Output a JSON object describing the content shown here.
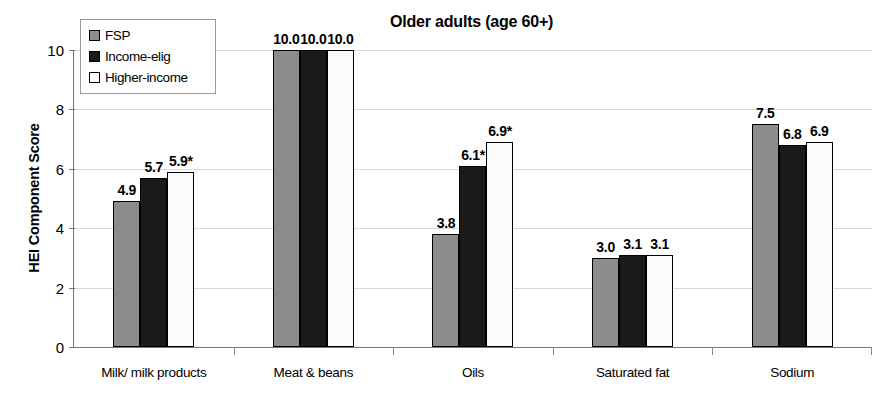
{
  "chart_data": {
    "type": "bar",
    "title": "Older adults (age 60+)",
    "xlabel": "",
    "ylabel": "HEI Component Score",
    "ylim": [
      0,
      10
    ],
    "yticks": [
      0,
      2,
      4,
      6,
      8,
      10
    ],
    "ytick_labels": [
      "0",
      "2",
      "4",
      "6",
      "8",
      "10"
    ],
    "grid": true,
    "legend_position": "upper-left-inside",
    "categories": [
      "Milk/ milk products",
      "Meat & beans",
      "Oils",
      "Saturated fat",
      "Sodium"
    ],
    "series": [
      {
        "name": "FSP",
        "color": "#8c8c8c",
        "values": [
          4.9,
          10.0,
          3.8,
          3.0,
          7.5
        ],
        "labels": [
          "4.9",
          "10.0",
          "3.8",
          "3.0",
          "7.5"
        ]
      },
      {
        "name": "Income-elig",
        "color": "#1a1a1a",
        "values": [
          5.7,
          10.0,
          6.1,
          3.1,
          6.8
        ],
        "labels": [
          "5.7",
          "10.0",
          "6.1*",
          "3.1",
          "6.8"
        ]
      },
      {
        "name": "Higher-income",
        "color": "#ffffff",
        "values": [
          5.9,
          10.0,
          6.9,
          3.1,
          6.9
        ],
        "labels": [
          "5.9*",
          "10.0",
          "6.9*",
          "3.1",
          "6.9"
        ]
      }
    ],
    "annotations": [
      "* denotes statistically significant difference"
    ]
  },
  "legend": {
    "items": [
      {
        "label": "FSP"
      },
      {
        "label": "Income-elig"
      },
      {
        "label": "Higher-income"
      }
    ]
  }
}
